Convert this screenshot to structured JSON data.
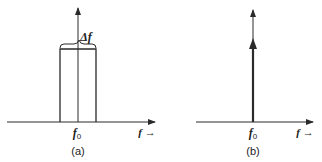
{
  "panels": [
    {
      "id": "a",
      "caption": "(a)",
      "center_label": "f",
      "center_sub": "0",
      "axis_label": "f →",
      "bandwidth_label": "Δf",
      "shape": "rectangular spectrum of width Δf centered at f0"
    },
    {
      "id": "b",
      "caption": "(b)",
      "center_label": "f",
      "center_sub": "0",
      "axis_label": "f →",
      "shape": "spectral line (impulse) at f0"
    }
  ],
  "colors": {
    "line": "#2a2a2a",
    "background": "#ffffff"
  }
}
